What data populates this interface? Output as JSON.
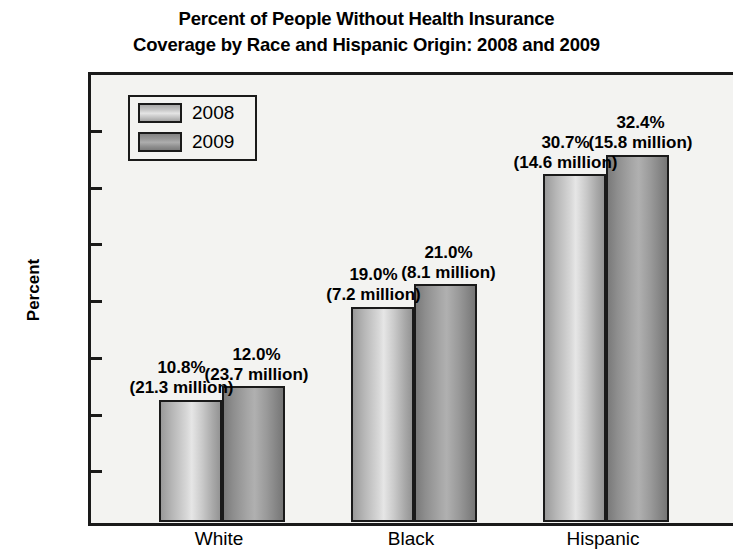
{
  "chart_data": {
    "type": "bar",
    "title": "Percent of People Without Health Insurance Coverage by Race and Hispanic Origin: 2008 and 2009",
    "title_line1": "Percent of People Without Health Insurance",
    "title_line2": "Coverage by Race and Hispanic Origin: 2008 and 2009",
    "xlabel": "",
    "ylabel": "Percent",
    "ylim": [
      0.0,
      35.0
    ],
    "ytick_labels": [
      "35.0",
      "30.0",
      "25.0",
      "20.0",
      "15.0",
      "10.0",
      "5.0",
      "0.0"
    ],
    "ytick_values": [
      35.0,
      30.0,
      25.0,
      20.0,
      15.0,
      10.0,
      5.0,
      0.0
    ],
    "grid": false,
    "legend_position": "upper-left-inside",
    "categories": [
      "White",
      "Black",
      "Hispanic"
    ],
    "series": [
      {
        "name": "2008",
        "values": [
          10.8,
          19.0,
          30.7
        ],
        "counts": [
          "21.3 million",
          "7.2 million",
          "14.6 million"
        ],
        "labels_pct": [
          "10.8%",
          "19.0%",
          "30.7%"
        ],
        "labels_cnt": [
          "(21.3 million)",
          "(7.2 million)",
          "(14.6 million)"
        ],
        "color": "#c9c9c9"
      },
      {
        "name": "2009",
        "values": [
          12.0,
          21.0,
          32.4
        ],
        "counts": [
          "23.7 million",
          "8.1 million",
          "15.8 million"
        ],
        "labels_pct": [
          "12.0%",
          "21.0%",
          "32.4%"
        ],
        "labels_cnt": [
          "(23.7 million)",
          "(8.1 million)",
          "(15.8 million)"
        ],
        "color": "#9a9a9a"
      }
    ]
  },
  "legend": {
    "items": [
      {
        "label": "2008"
      },
      {
        "label": "2009"
      }
    ]
  },
  "colors": {
    "plot_background": "#f3f3f1",
    "frame": "#1a1a1a",
    "page_background": "#ffffff",
    "bar_2008": "#c9c9c9",
    "bar_2009": "#9a9a9a"
  }
}
